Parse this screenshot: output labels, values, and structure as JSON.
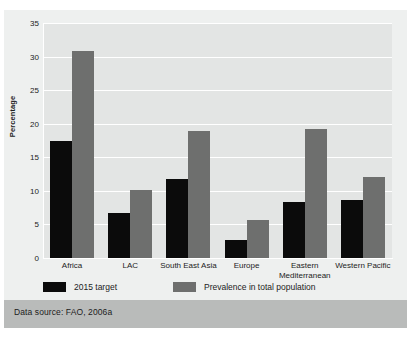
{
  "figure": {
    "source_note": "Data source: FAO, 2006a",
    "colors": {
      "target": "#0b0b0b",
      "prevalence": "#6e6f6e",
      "plot_background": "#e3e5e4",
      "panel_background": "#eef0ef",
      "source_band": "#b9bbba",
      "gridline": "#ffffff"
    }
  },
  "chart_data": {
    "type": "bar",
    "title": "",
    "xlabel": "",
    "ylabel": "Percentage",
    "ylim": [
      0,
      35
    ],
    "yticks": [
      0,
      5,
      10,
      15,
      20,
      25,
      30,
      35
    ],
    "ytick_labels": [
      "0",
      "5",
      "10",
      "15",
      "20",
      "25",
      "30",
      "35"
    ],
    "grid": true,
    "legend_position": "below-axes-left",
    "categories": [
      "Africa",
      "LAC",
      "South East Asia",
      "Europe",
      "Eastern\nMediterranean",
      "Western Pacific"
    ],
    "category_labels": [
      "Africa",
      "LAC",
      "South East Asia",
      "Europe",
      "Eastern\nMediterranean",
      "Western Pacific"
    ],
    "series": [
      {
        "name": "2015 target",
        "color": "#0b0b0b",
        "values": [
          17.4,
          6.7,
          11.7,
          2.7,
          8.4,
          8.6
        ]
      },
      {
        "name": "Prevalence in total population",
        "color": "#6e6f6e",
        "values": [
          30.8,
          10.1,
          18.9,
          5.6,
          19.2,
          12.0
        ]
      }
    ]
  }
}
